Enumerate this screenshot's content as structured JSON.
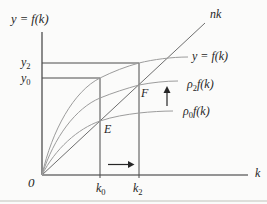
{
  "colors": {
    "bg": "#fbfbfa",
    "text": "#1f1f1f",
    "axis": "#2f2f2f",
    "guide": "#4a4a4a",
    "ray": "#6e6e6e",
    "curve": "#9c9c9c",
    "arrow": "#262626",
    "scan": "#dededa"
  },
  "labels": {
    "y_axis_title": {
      "pre": "y = f(k)"
    },
    "x_axis": {
      "pre": "k"
    },
    "origin": {
      "pre": "0"
    },
    "ray_nk": {
      "pre": "nk"
    },
    "curve_top": {
      "pre": "y = f(k)"
    },
    "curve_mid": {
      "pre": "ρ",
      "sub": "2",
      "post": "f(k)"
    },
    "curve_bot": {
      "pre": "ρ",
      "sub": "0",
      "post": "f(k)"
    },
    "y2": {
      "pre": "y",
      "sub": "2"
    },
    "y0": {
      "pre": "y",
      "sub": "0"
    },
    "k0": {
      "pre": "k",
      "sub": "0"
    },
    "k2": {
      "pre": "k",
      "sub": "2"
    },
    "point_E": {
      "pre": "E"
    },
    "point_F": {
      "pre": "F"
    }
  }
}
